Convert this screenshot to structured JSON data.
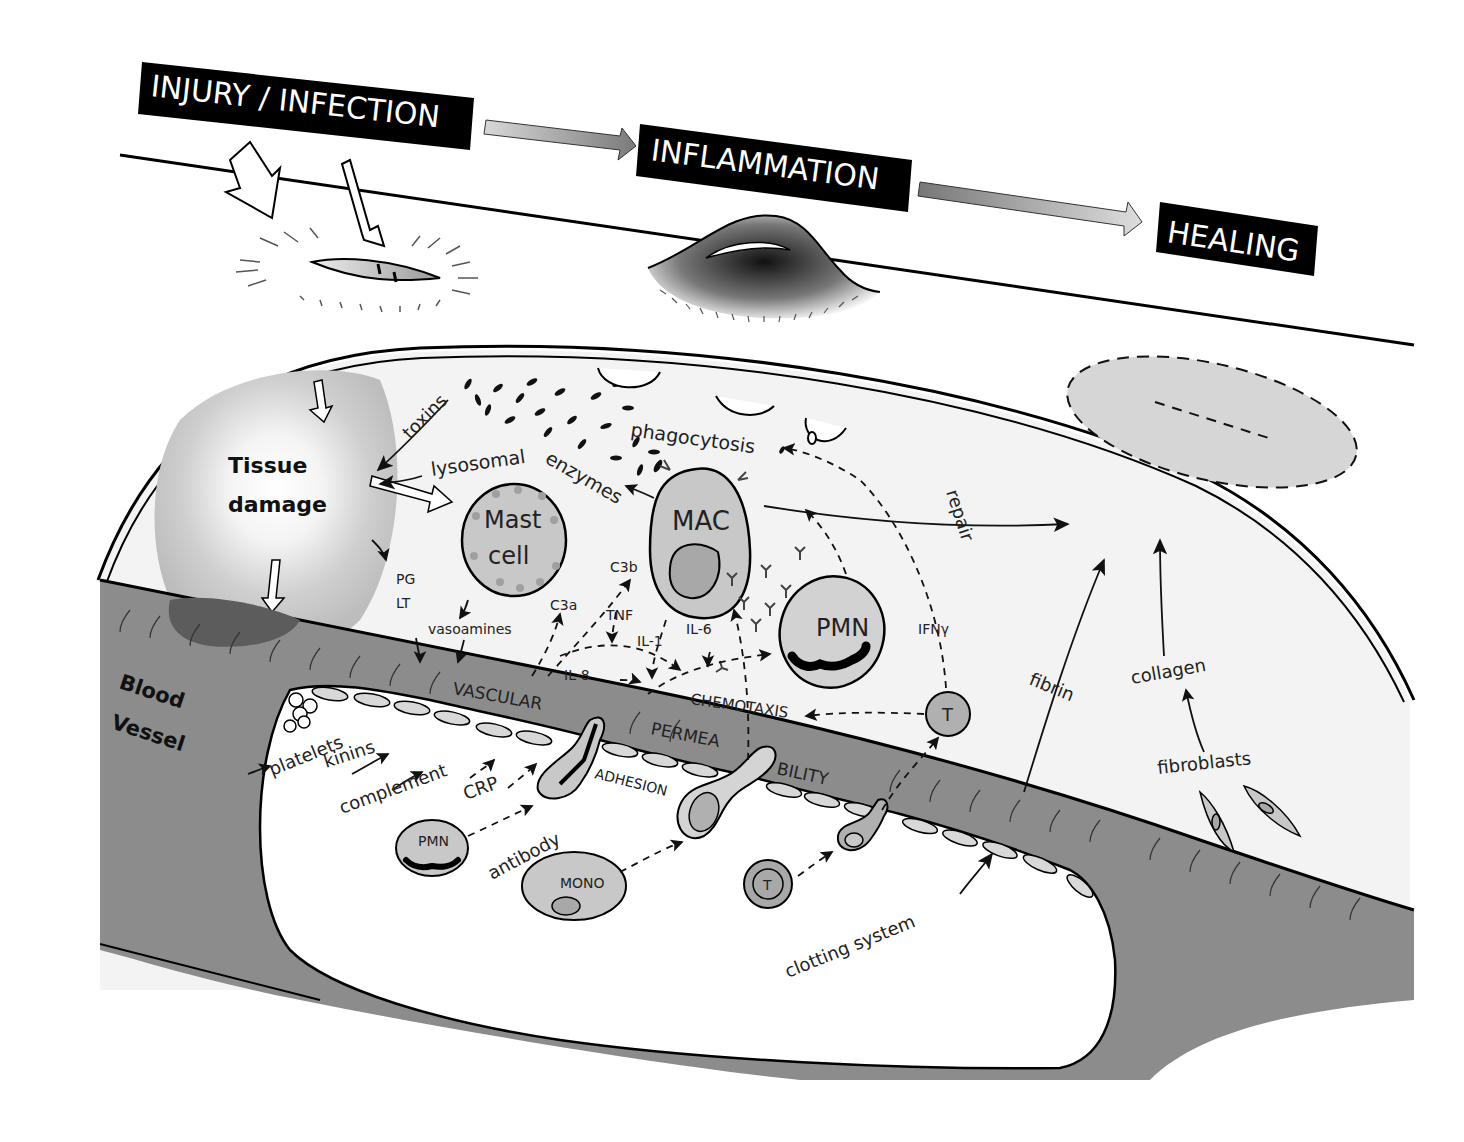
{
  "stages": {
    "injury": "INJURY / INFECTION",
    "inflammation": "INFLAMMATION",
    "healing": "HEALING"
  },
  "regions": {
    "tissue_damage_line1": "Tissue",
    "tissue_damage_line2": "damage",
    "blood_vessel_line1": "Blood",
    "blood_vessel_line2": "Vessel"
  },
  "cells": {
    "mast_line1": "Mast",
    "mast_line2": "cell",
    "mac": "MAC",
    "pmn_tissue": "PMN",
    "t_tissue": "T",
    "pmn_vessel": "PMN",
    "mono": "MONO",
    "t_vessel": "T"
  },
  "labels": {
    "toxins": "toxins",
    "phagocytosis": "phagocytosis",
    "lysosomal_enzymes": "lysosomal enzymes",
    "repair": "repair",
    "pg": "PG",
    "lt": "LT",
    "vasoamines": "vasoamines",
    "c3a": "C3a",
    "c3b": "C3b",
    "tnf": "TNF",
    "il1": "IL-1",
    "il6": "IL-6",
    "il8": "IL-8",
    "ifn_gamma": "IFNγ",
    "chemotaxis": "CHEMOTAXIS",
    "vascular": "VASCULAR",
    "permea": "PERMEA",
    "bility": "BILITY",
    "adhesion": "ADHESION",
    "platelets": "platelets",
    "kinins": "kinins",
    "complement": "complement",
    "crp": "CRP",
    "antibody": "antibody",
    "clotting_system": "clotting system",
    "fibrin": "fibrin",
    "collagen": "collagen",
    "fibroblasts": "fibroblasts"
  },
  "colors": {
    "banner": "#000000",
    "vessel_wall": "#8c8c8c",
    "tissue_fill": "#f2f2f2",
    "cell_fill": "#c8c8c8",
    "nucleus_fill": "#a8a8a8",
    "scar_fill": "#d4d4d4"
  }
}
